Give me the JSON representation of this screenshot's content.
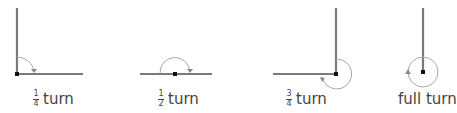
{
  "diagrams": [
    {
      "id": "quarter",
      "fraction": {
        "num": "1",
        "den": "4"
      },
      "word": "turn"
    },
    {
      "id": "half",
      "fraction": {
        "num": "1",
        "den": "2"
      },
      "word": "turn"
    },
    {
      "id": "three-quarter",
      "fraction": {
        "num": "3",
        "den": "4"
      },
      "word": "turn"
    },
    {
      "id": "full",
      "word": "full turn"
    }
  ]
}
